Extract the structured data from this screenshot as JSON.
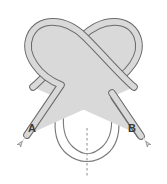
{
  "figure": {
    "name": "knot-loop-diagram",
    "background_color": "#ffffff",
    "width": 167,
    "height": 184
  },
  "labels": {
    "left_end": "A",
    "right_end": "B"
  },
  "colors": {
    "ribbon_fill": "#d9d9d9",
    "ribbon_stroke": "#6b6b6b",
    "thin_stroke": "#7a7a7a",
    "dashed_axis": "#8c8c8c",
    "label_text": "#3a3a3a"
  },
  "strands": {
    "left_ribbon": {
      "name": "left-strand",
      "path": "M 24 138 L 62 84 C 40 78 22 56 30 36 C 38 16 66 16 86 36 C 106 56 122 76 136 88",
      "width": 7
    },
    "right_ribbon": {
      "name": "right-strand",
      "path": "M 143 138 L 105 84 C 127 78 145 56 137 36 C 129 16 101 16 81 36 C 61 56 45 76 31 88",
      "width": 7
    },
    "bottom_loop": {
      "name": "bottom-teardrop-loop",
      "outer_path": "M 70 82 C 52 108 52 140 68 154 C 80 164 94 164 106 154 C 122 140 122 108 104 82",
      "inner_path": "M 76 80 C 60 106 60 136 73 149 C 83 158 92 158 102 149 C 115 136 115 106 99 80",
      "width": 1.1
    }
  },
  "arrows": {
    "left_arrow": {
      "name": "arrow-a",
      "tip_x": 17,
      "tip_y": 147,
      "direction": "down-left"
    },
    "right_arrow": {
      "name": "arrow-b",
      "tip_x": 150,
      "tip_y": 147,
      "direction": "down-right"
    }
  },
  "axis": {
    "name": "symmetry-axis",
    "style": "dashed",
    "x": 87,
    "y_top": 128,
    "y_bottom": 176
  }
}
